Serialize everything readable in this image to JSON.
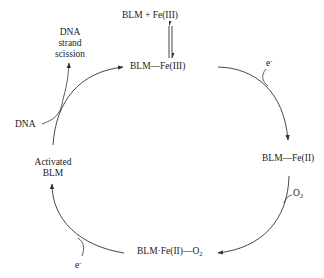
{
  "diagram": {
    "nodes": [
      {
        "id": "blm_fe3_free",
        "label_main": "BLM  + Fe(III)"
      },
      {
        "id": "blm_fe3",
        "label_main": "BLM—Fe(III)"
      },
      {
        "id": "blm_fe2",
        "label_main": "BLM—Fe(II)"
      },
      {
        "id": "blm_fe2_o2",
        "label_main": "BLM·Fe(II)—O",
        "label_sub": "2"
      },
      {
        "id": "activated_blm",
        "label_line1": "Activated",
        "label_line2": "BLM"
      }
    ],
    "side_labels": {
      "dna_in": "DNA",
      "dna_out_line1": "DNA",
      "dna_out_line2": "strand",
      "dna_out_line3": "scission",
      "electron_top": "e",
      "electron_top_sup": "-",
      "electron_bottom": "e",
      "electron_bottom_sup": "-",
      "oxygen": "O",
      "oxygen_sub": "2"
    },
    "edges": [
      {
        "from": "blm_fe3_free",
        "to": "blm_fe3",
        "type": "equilibrium"
      },
      {
        "from": "blm_fe3",
        "to": "blm_fe2",
        "input": "e-"
      },
      {
        "from": "blm_fe2",
        "to": "blm_fe2_o2",
        "input": "O2"
      },
      {
        "from": "blm_fe2_o2",
        "to": "activated_blm",
        "input": "e-"
      },
      {
        "from": "activated_blm",
        "to": "blm_fe3",
        "input": "DNA",
        "output": "DNA strand scission"
      }
    ],
    "colors": {
      "stroke": "#333333",
      "text": "#222222",
      "background": "#ffffff"
    }
  }
}
